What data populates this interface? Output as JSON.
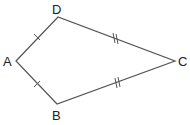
{
  "diagram": {
    "type": "kite",
    "stroke_color": "#555555",
    "vertices": [
      {
        "name": "A",
        "x": 16,
        "y": 61,
        "label_x": 3,
        "label_y": 66
      },
      {
        "name": "B",
        "x": 57,
        "y": 104,
        "label_x": 52,
        "label_y": 120
      },
      {
        "name": "C",
        "x": 175,
        "y": 61,
        "label_x": 178,
        "label_y": 66
      },
      {
        "name": "D",
        "x": 58,
        "y": 17,
        "label_x": 52,
        "label_y": 14
      }
    ],
    "edges": [
      {
        "from": "A",
        "to": "D",
        "ticks": 1
      },
      {
        "from": "D",
        "to": "C",
        "ticks": 2
      },
      {
        "from": "C",
        "to": "B",
        "ticks": 2
      },
      {
        "from": "B",
        "to": "A",
        "ticks": 1
      }
    ],
    "labels": {
      "A": "A",
      "B": "B",
      "C": "C",
      "D": "D"
    }
  }
}
